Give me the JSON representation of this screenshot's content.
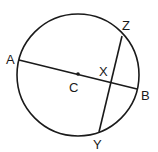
{
  "diagram": {
    "type": "circle-geometry",
    "stroke_color": "#1a1a1a",
    "background": "#ffffff",
    "circle": {
      "center": "C",
      "cx": 78,
      "cy": 75,
      "r": 61
    },
    "points": {
      "A": {
        "label": "A",
        "x": 19,
        "y": 60
      },
      "B": {
        "label": "B",
        "x": 137,
        "y": 89
      },
      "C": {
        "label": "C",
        "x": 78,
        "y": 74
      },
      "X": {
        "label": "X",
        "x": 110,
        "y": 81
      },
      "Y": {
        "label": "Y",
        "x": 99,
        "y": 132
      },
      "Z": {
        "label": "Z",
        "x": 122,
        "y": 36
      }
    },
    "segments": [
      {
        "name": "AB",
        "from": "A",
        "to": "B",
        "kind": "diameter"
      },
      {
        "name": "ZY",
        "from": "Z",
        "to": "Y",
        "kind": "chord"
      }
    ],
    "labels": {
      "A": "A",
      "B": "B",
      "C": "C",
      "X": "X",
      "Y": "Y",
      "Z": "Z"
    }
  }
}
